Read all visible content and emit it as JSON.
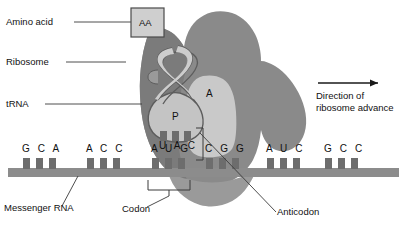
{
  "figure": {
    "background_color": "#ffffff",
    "colors": {
      "ribosome_body": "#8a8a8a",
      "ribosome_left_lobe": "#7e7e7e",
      "ribosome_lower": "#9b9b9b",
      "site_fill": "#c9c9c9",
      "trna_fill": "#c4c4c4",
      "trna_stroke": "#5d5d5d",
      "mrna_bar": "#8c8c8c",
      "mrna_tick": "#6d6d6d",
      "aa_box_fill": "#cfcfcf",
      "aa_box_stroke": "#4a4a4a",
      "leader_line": "#3a3a3a",
      "text": "#111111"
    }
  },
  "labels": {
    "amino_acid": "Amino acid",
    "ribosome": "Ribosome",
    "trna": "tRNA",
    "messenger_rna": "Messenger RNA",
    "codon": "Codon",
    "anticodon": "Anticodon",
    "direction_line1": "Direction of",
    "direction_line2": "ribosome advance"
  },
  "ribosome": {
    "p_site": "P",
    "a_site": "A",
    "amino_acid_box": "AA"
  },
  "sequences": {
    "anticodon_bases": "U A C",
    "anticodon_letters": [
      "U",
      "A",
      "C"
    ],
    "mrna_codons": [
      "G C A",
      "A C C",
      "A U G",
      "C G G",
      "A U C",
      "G C C"
    ],
    "mrna_bases": [
      "G",
      "C",
      "A",
      "A",
      "C",
      "C",
      "A",
      "U",
      "G",
      "C",
      "G",
      "G",
      "A",
      "U",
      "C",
      "G",
      "C",
      "C"
    ],
    "mrna_full": "GCA ACC AUG CGG AUC GCC",
    "codon_in_p_site": "A U G",
    "codon_in_a_site": "C G G"
  },
  "arrow": {
    "direction": "right",
    "icon": "arrow-right-icon"
  }
}
